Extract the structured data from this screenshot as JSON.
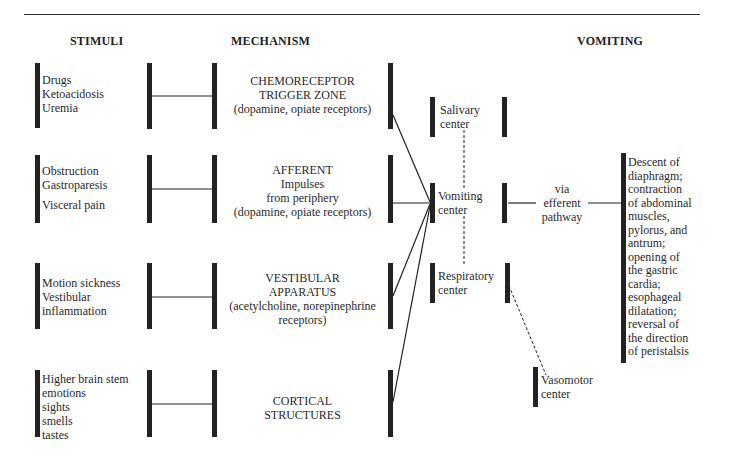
{
  "headers": {
    "stimuli": "STIMULI",
    "mechanism": "MECHANISM",
    "vomiting": "VOMITING"
  },
  "stimuli": [
    {
      "lines": [
        "Drugs",
        "Ketoacidosis",
        "Uremia"
      ]
    },
    {
      "lines": [
        "Obstruction",
        "Gastroparesis",
        "",
        "Visceral pain"
      ]
    },
    {
      "lines": [
        "Motion sickness",
        "Vestibular",
        "inflammation"
      ]
    },
    {
      "lines": [
        "Higher brain stem",
        "emotions",
        "sights",
        "smells",
        "tastes"
      ]
    }
  ],
  "mechanisms": [
    {
      "lines": [
        "CHEMORECEPTOR",
        "TRIGGER ZONE",
        "(dopamine, opiate receptors)"
      ]
    },
    {
      "lines": [
        "AFFERENT",
        "Impulses",
        "from periphery",
        "(dopamine, opiate receptors)"
      ]
    },
    {
      "lines": [
        "VESTIBULAR",
        "APPARATUS",
        "(acetylcholine, norepinephrine",
        "receptors)"
      ]
    },
    {
      "lines": [
        "CORTICAL",
        "STRUCTURES"
      ]
    }
  ],
  "centers": {
    "salivary": [
      "Salivary",
      "center"
    ],
    "vomiting": [
      "Vomiting",
      "center"
    ],
    "respiratory": [
      "Respiratory",
      "center"
    ],
    "vasomotor": [
      "Vasomotor",
      "center"
    ]
  },
  "efferent": [
    "via",
    "efferent",
    "pathway"
  ],
  "outcome": [
    "Descent of",
    "diaphragm;",
    "contraction",
    "of abdominal",
    "muscles,",
    "pylorus, and",
    "antrum;",
    "opening of",
    "the gastric",
    "cardia;",
    "esophageal",
    "dilatation;",
    "reversal of",
    "the direction",
    "of peristalsis"
  ],
  "colors": {
    "ink": "#222222",
    "background": "#ffffff"
  }
}
